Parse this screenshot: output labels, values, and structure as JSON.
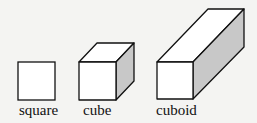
{
  "figure": {
    "shapes": [
      {
        "id": "square",
        "label": "square"
      },
      {
        "id": "cube",
        "label": "cube"
      },
      {
        "id": "cuboid",
        "label": "cuboid"
      }
    ],
    "colors": {
      "background": "#f4f4f2",
      "stroke": "#111111",
      "face": "#ffffff",
      "shade": "#c8c8c8"
    }
  }
}
